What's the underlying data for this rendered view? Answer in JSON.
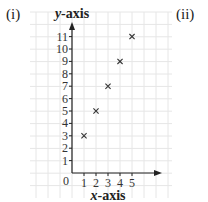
{
  "labels": {
    "left": "(i)",
    "right": "(ii)"
  },
  "chart_data": {
    "type": "scatter",
    "title": "",
    "xlabel": "x-axis",
    "ylabel": "y-axis",
    "x": [
      1,
      2,
      3,
      4,
      5
    ],
    "y": [
      3,
      5,
      7,
      9,
      11
    ],
    "x_ticks": [
      1,
      2,
      3,
      4,
      5
    ],
    "y_ticks": [
      1,
      2,
      3,
      4,
      5,
      6,
      7,
      8,
      9,
      10,
      11
    ],
    "origin_label": "0",
    "marker": "x",
    "grid": true,
    "xlim": [
      0,
      7.5
    ],
    "ylim": [
      0,
      12
    ]
  }
}
